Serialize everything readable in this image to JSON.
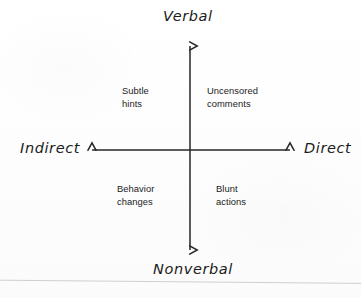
{
  "diagram": {
    "type": "quadrant-chart",
    "title": "",
    "background_color": "#fefefe",
    "line_color": "#262626",
    "axis_label_color": "#1b1b1b",
    "quadrant_label_color": "#222222",
    "axes": {
      "vertical": {
        "top_label": "Verbal",
        "bottom_label": "Nonverbal",
        "x": 190,
        "y_top": 38,
        "y_bottom": 258,
        "arrowheads": [
          "top",
          "bottom"
        ]
      },
      "horizontal": {
        "left_label": "Indirect",
        "right_label": "Direct",
        "y": 150,
        "x_left": 84,
        "x_right": 298,
        "arrowheads": [
          "left",
          "right"
        ]
      }
    },
    "quadrants": [
      {
        "position": "top-left",
        "axes": "Verbal + Indirect",
        "label": "Subtle\nhints",
        "line1": "Subtle",
        "line2": "hints"
      },
      {
        "position": "top-right",
        "axes": "Verbal + Direct",
        "label": "Uncensored\ncomments",
        "line1": "Uncensored",
        "line2": "comments"
      },
      {
        "position": "bottom-left",
        "axes": "Nonverbal + Indirect",
        "label": "Behavior\nchanges",
        "line1": "Behavior",
        "line2": "changes"
      },
      {
        "position": "bottom-right",
        "axes": "Nonverbal + Direct",
        "label": "Blunt\nactions",
        "line1": "Blunt",
        "line2": "actions"
      }
    ]
  }
}
